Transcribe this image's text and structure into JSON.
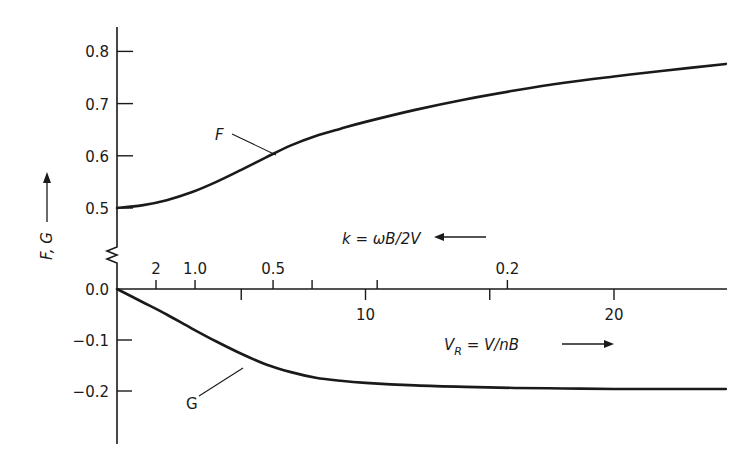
{
  "chart_data": {
    "type": "line",
    "title": "",
    "xlabel": "V_R = V/nB",
    "ylabel": "F, G",
    "xlim": [
      0,
      24.5
    ],
    "ylim_upper": [
      0.45,
      0.85
    ],
    "ylim_lower": [
      -0.3,
      0.0
    ],
    "y_axis_break": true,
    "grid": false,
    "y_ticks_upper": [
      {
        "value": 0.8,
        "label": "0.8"
      },
      {
        "value": 0.7,
        "label": "0.7"
      },
      {
        "value": 0.6,
        "label": "0.6"
      },
      {
        "value": 0.5,
        "label": "0.5"
      }
    ],
    "y_ticks_lower": [
      {
        "value": 0.0,
        "label": "0.0"
      },
      {
        "value": -0.1,
        "label": "−0.1"
      },
      {
        "value": -0.2,
        "label": "−0.2"
      }
    ],
    "x_ticks": [
      {
        "value": 5,
        "label": ""
      },
      {
        "value": 10,
        "label": "10"
      },
      {
        "value": 15,
        "label": ""
      },
      {
        "value": 20,
        "label": "20"
      }
    ],
    "secondary_x_axis": {
      "label": "k = ωB/2V",
      "direction": "decreasing (arrow points left)",
      "ticks": [
        {
          "k": 2,
          "x": 1.57,
          "label": "2"
        },
        {
          "k": 1.0,
          "x": 3.14,
          "label": "1.0"
        },
        {
          "k": 0.5,
          "x": 6.28,
          "label": "0.5"
        },
        {
          "k": 0.4,
          "x": 7.85,
          "label": ""
        },
        {
          "k": 0.3,
          "x": 10.47,
          "label": ""
        },
        {
          "k": 0.2,
          "x": 15.71,
          "label": "0.2"
        }
      ]
    },
    "series": [
      {
        "name": "F",
        "x": [
          0,
          1,
          2,
          3,
          4,
          5,
          6,
          7,
          8,
          9,
          10,
          12,
          14,
          16,
          18,
          20,
          22,
          24.5
        ],
        "y": [
          0.5,
          0.505,
          0.515,
          0.53,
          0.55,
          0.573,
          0.597,
          0.62,
          0.638,
          0.652,
          0.665,
          0.688,
          0.708,
          0.725,
          0.74,
          0.752,
          0.763,
          0.776
        ]
      },
      {
        "name": "G",
        "x": [
          0,
          1,
          2,
          3,
          4,
          5,
          6,
          7,
          8,
          9,
          10,
          12,
          14,
          16,
          18,
          20,
          22,
          24.5
        ],
        "y": [
          0.0,
          -0.025,
          -0.05,
          -0.077,
          -0.103,
          -0.127,
          -0.148,
          -0.163,
          -0.174,
          -0.18,
          -0.184,
          -0.189,
          -0.192,
          -0.194,
          -0.195,
          -0.196,
          -0.196,
          -0.196
        ]
      }
    ],
    "annotations": [
      {
        "text": "F",
        "points_to_series": "F",
        "at_x": 5.0
      },
      {
        "text": "G",
        "points_to_series": "G",
        "at_x": 5.9
      },
      {
        "text": "k = ωB/2V",
        "arrow": "left"
      },
      {
        "text": "V_R = V/nB",
        "arrow": "right"
      },
      {
        "text": "F, G",
        "arrow": "up"
      }
    ]
  },
  "labels": {
    "y_axis_label": "F, G",
    "k_label_prefix": "k = ",
    "k_label_expr": "ωB/2V",
    "vr_label_v": "V",
    "vr_label_sub": "R",
    "vr_label_expr": " = V/nB",
    "f_label": "F",
    "g_label": "G"
  }
}
